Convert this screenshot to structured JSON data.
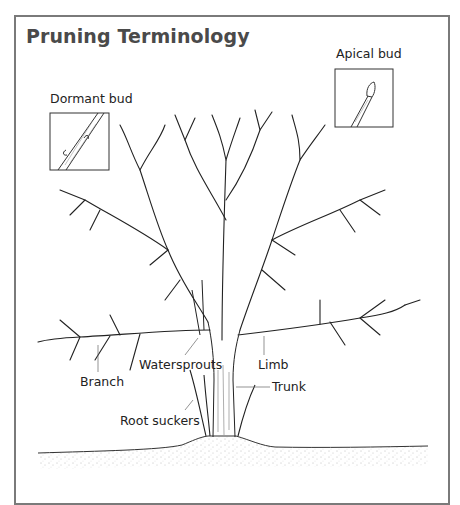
{
  "title": "Pruning Terminology",
  "labels": {
    "dormant_bud": "Dormant bud",
    "apical_bud": "Apical bud",
    "branch": "Branch",
    "watersprouts": "Watersprouts",
    "limb": "Limb",
    "trunk": "Trunk",
    "root_suckers": "Root suckers"
  }
}
